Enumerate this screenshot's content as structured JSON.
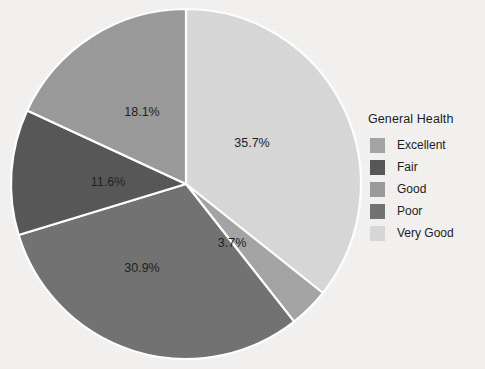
{
  "chart_data": {
    "type": "pie",
    "title": "",
    "legend_title": "General Health",
    "legend_position": "right",
    "categories": [
      "Very Good",
      "Excellent",
      "Poor",
      "Fair",
      "Good"
    ],
    "values": [
      35.7,
      3.7,
      30.9,
      11.6,
      18.1
    ],
    "value_suffix": "%",
    "start_angle_deg": 0,
    "direction": "clockwise",
    "slices": [
      {
        "label": "Very Good",
        "value": 35.7,
        "display": "35.7%",
        "color": "#d8d8d8",
        "label_x": 252,
        "label_y": 147
      },
      {
        "label": "Excellent",
        "value": 3.7,
        "display": "3.7%",
        "color": "#a5a5a5",
        "label_x": 232,
        "label_y": 247
      },
      {
        "label": "Poor",
        "value": 30.9,
        "display": "30.9%",
        "color": "#737373",
        "label_x": 142,
        "label_y": 272
      },
      {
        "label": "Fair",
        "value": 11.6,
        "display": "11.6%",
        "color": "#585858",
        "label_x": 108,
        "label_y": 186
      },
      {
        "label": "Good",
        "value": 18.1,
        "display": "18.1%",
        "color": "#9b9b9b",
        "label_x": 142,
        "label_y": 116
      }
    ],
    "separator_color": "#ffffff",
    "background_color": "#f3f2f0"
  },
  "legend": {
    "title": "General Health",
    "items": [
      {
        "label": "Excellent",
        "color": "#a5a5a5"
      },
      {
        "label": "Fair",
        "color": "#585858"
      },
      {
        "label": "Good",
        "color": "#9b9b9b"
      },
      {
        "label": "Poor",
        "color": "#737373"
      },
      {
        "label": "Very Good",
        "color": "#d8d8d8"
      }
    ]
  }
}
